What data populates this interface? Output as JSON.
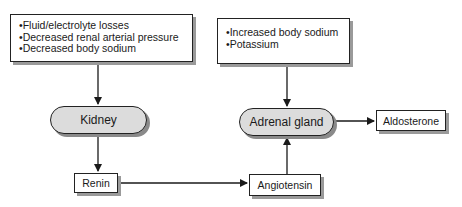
{
  "diagram": {
    "inputs_left": {
      "items": [
        "•Fluid/electrolyte losses",
        "•Decreased renal arterial pressure",
        "•Decreased body sodium"
      ]
    },
    "inputs_right": {
      "items": [
        "•Increased body sodium",
        "•Potassium"
      ]
    },
    "nodes": {
      "kidney": "Kidney",
      "adrenal": "Adrenal gland",
      "renin": "Renin",
      "angiotensin": "Angiotensin",
      "aldosterone": "Aldosterone"
    },
    "edges": [
      {
        "from": "inputs_left",
        "to": "kidney"
      },
      {
        "from": "kidney",
        "to": "renin"
      },
      {
        "from": "renin",
        "to": "angiotensin"
      },
      {
        "from": "angiotensin",
        "to": "adrenal"
      },
      {
        "from": "inputs_right",
        "to": "adrenal"
      },
      {
        "from": "adrenal",
        "to": "aldosterone"
      }
    ]
  }
}
